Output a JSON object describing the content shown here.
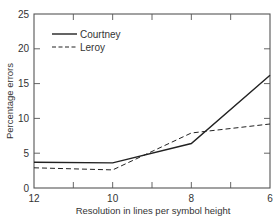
{
  "chart_data": {
    "type": "line",
    "title": "",
    "xlabel": "Resolution in lines per symbol height",
    "ylabel": "Percentage errors",
    "x": [
      12,
      10,
      8,
      6
    ],
    "xticks": [
      "12",
      "10",
      "8",
      "6"
    ],
    "xlim": [
      12,
      6
    ],
    "x_reversed": true,
    "yticks": [
      "0",
      "5",
      "10",
      "15",
      "20",
      "25"
    ],
    "ylim": [
      0,
      25
    ],
    "grid": false,
    "legend_position": "upper-left",
    "series": [
      {
        "name": "Courtney",
        "style": "solid",
        "values": [
          3.7,
          3.6,
          6.4,
          16.2
        ]
      },
      {
        "name": "Leroy",
        "style": "dashed",
        "values": [
          2.9,
          2.6,
          7.9,
          9.2
        ]
      }
    ]
  },
  "colors": {
    "line": "#222222",
    "axis": "#555555",
    "text": "#333333",
    "background": "#ffffff"
  }
}
